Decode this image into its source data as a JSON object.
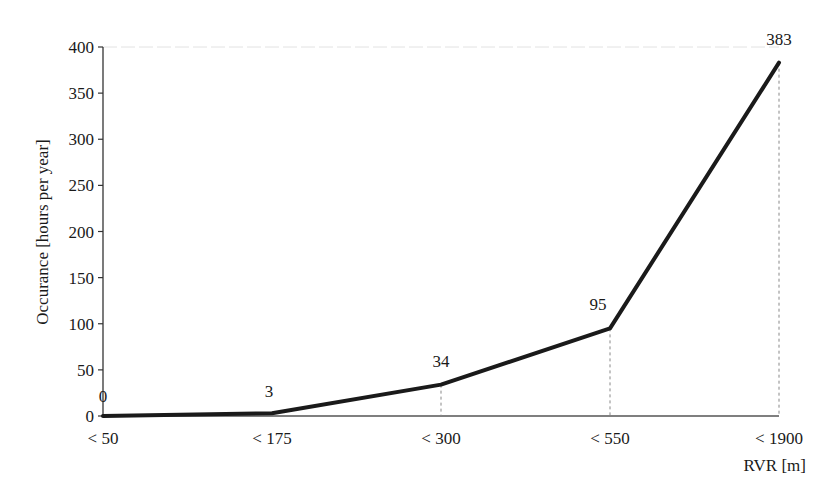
{
  "chart_data": {
    "type": "line",
    "title": "",
    "xlabel": "RVR [m]",
    "ylabel": "Occurance [hours per year]",
    "categories": [
      "< 50",
      "< 175",
      "< 300",
      "< 550",
      "< 1900"
    ],
    "series": [
      {
        "name": "Occurance",
        "values": [
          0,
          3,
          34,
          95,
          383
        ],
        "color": "#1a1a1a"
      }
    ],
    "data_labels": [
      "0",
      "3",
      "34",
      "95",
      "383"
    ],
    "ylim": [
      0,
      400
    ],
    "yticks": [
      0,
      50,
      100,
      150,
      200,
      250,
      300,
      350,
      400
    ],
    "ytick_labels": [
      "0",
      "50",
      "100",
      "150",
      "200",
      "250",
      "300",
      "350",
      "400"
    ],
    "grid": false,
    "drop_lines": true,
    "legend": null
  }
}
